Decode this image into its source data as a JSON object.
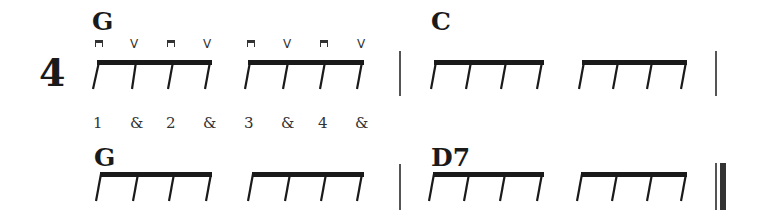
{
  "time_signature": "4",
  "rows": [
    {
      "measures": [
        {
          "chord": "G",
          "groups": 2
        },
        {
          "chord": "C",
          "groups": 2
        }
      ],
      "strokes": [
        "down",
        "up",
        "down",
        "up",
        "down",
        "up",
        "down",
        "up"
      ],
      "stroke_glyphs": {
        "down": "⊓",
        "up": "V"
      },
      "counts": [
        "1",
        "&",
        "2",
        "&",
        "3",
        "&",
        "4",
        "&"
      ],
      "end_bar": "single"
    },
    {
      "measures": [
        {
          "chord": "G",
          "groups": 2
        },
        {
          "chord": "D7",
          "groups": 2
        }
      ],
      "end_bar": "final"
    }
  ],
  "colors": {
    "ink": "#1a1a1a",
    "barline": "#555555",
    "paper": "#ffffff"
  }
}
